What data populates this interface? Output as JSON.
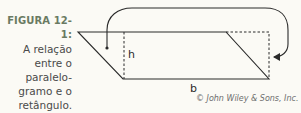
{
  "caption": {
    "label": "FIGURA 12-1:",
    "lines": [
      "A relação",
      "entre o",
      "paralelo-",
      "gramo e o",
      "retângulo."
    ]
  },
  "diagram": {
    "height_label": "h",
    "base_label": "b",
    "stroke_color": "#2a2a2a"
  },
  "credit": "© John Wiley & Sons, Inc."
}
